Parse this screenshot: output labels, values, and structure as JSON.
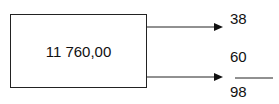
{
  "box": {
    "value": "11 760,00"
  },
  "arrows": [
    {
      "label": "38"
    },
    {
      "label": "60",
      "denominator": "98"
    }
  ]
}
